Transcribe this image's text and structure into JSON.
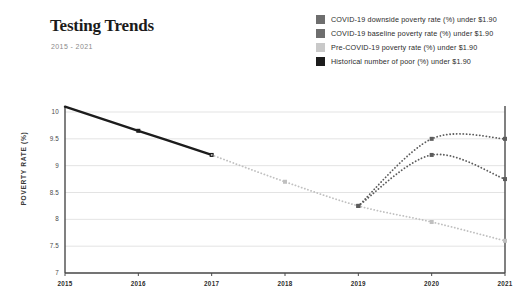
{
  "header": {
    "title": "Testing Trends",
    "subtitle": "2015 - 2021"
  },
  "legend": {
    "items": [
      {
        "label": "COVID-19 downside poverty rate (%) under $1.90",
        "color": "#6e6e6e"
      },
      {
        "label": "COVID-19 baseline poverty rate (%) under $1.90",
        "color": "#6e6e6e"
      },
      {
        "label": "Pre-COVID-19 poverty rate (%) under $1.90",
        "color": "#c9c9c9"
      },
      {
        "label": "Historical number of poor (%) under $1.90",
        "color": "#1c1c1c"
      }
    ]
  },
  "chart_data": {
    "type": "line",
    "title": "Testing Trends",
    "subtitle": "2015 - 2021",
    "xlabel": "",
    "ylabel": "POVERTY RATE (%)",
    "x": [
      2015,
      2016,
      2017,
      2018,
      2019,
      2020,
      2021
    ],
    "xticklabels": [
      "2015",
      "2016",
      "2017",
      "2018",
      "2019",
      "2020",
      "2021"
    ],
    "yticklabels": [
      "10",
      "9.5",
      "9",
      "8.5",
      "8",
      "7.5",
      "7"
    ],
    "yticks": [
      10,
      9.5,
      9,
      8.5,
      8,
      7.5,
      7
    ],
    "ylim": [
      7,
      10.25
    ],
    "xlim": [
      2015,
      2021
    ],
    "grid": "horizontal",
    "legend_position": "top-right",
    "series": [
      {
        "name": "Historical number of poor (%) under $1.90",
        "color": "#1c1c1c",
        "style": "solid",
        "width": 2.4,
        "x": [
          2015,
          2016,
          2017
        ],
        "values": [
          10.1,
          9.65,
          9.2
        ],
        "markers": [
          false,
          true,
          true
        ]
      },
      {
        "name": "Pre-COVID-19 poverty rate (%) under $1.90",
        "color": "#c0c0c0",
        "style": "dotted",
        "width": 1.8,
        "x": [
          2017,
          2018,
          2019,
          2020,
          2021
        ],
        "values": [
          9.2,
          8.7,
          8.25,
          7.95,
          7.6
        ],
        "markers": [
          false,
          true,
          true,
          true,
          true
        ]
      },
      {
        "name": "COVID-19 baseline poverty rate (%) under $1.90",
        "color": "#5c5c5c",
        "style": "dotted",
        "width": 1.8,
        "x": [
          2019,
          2020,
          2021
        ],
        "values": [
          8.25,
          9.2,
          8.75
        ],
        "markers": [
          true,
          true,
          true
        ]
      },
      {
        "name": "COVID-19 downside poverty rate (%) under $1.90",
        "color": "#5c5c5c",
        "style": "dotted",
        "width": 1.8,
        "x": [
          2019,
          2020,
          2021
        ],
        "values": [
          8.25,
          9.5,
          9.5
        ],
        "markers": [
          true,
          true,
          true
        ]
      }
    ]
  },
  "axes": {
    "axis_color": "#4a4a4a",
    "grid_color": "#dcdcdc"
  }
}
